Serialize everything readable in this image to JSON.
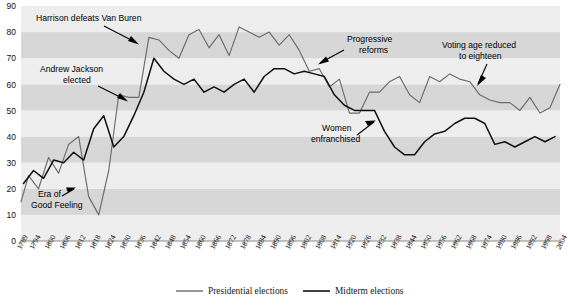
{
  "chart_data": {
    "type": "line",
    "title": "",
    "xlabel": "",
    "ylabel": "",
    "xlim": [
      1789,
      2004
    ],
    "ylim": [
      0,
      90
    ],
    "grid": "horizontal-bands",
    "legend_position": "bottom",
    "y_ticks": [
      0,
      10,
      20,
      30,
      40,
      50,
      60,
      70,
      80,
      90
    ],
    "x_ticks": [
      1789,
      1794,
      1800,
      1806,
      1812,
      1818,
      1824,
      1830,
      1836,
      1842,
      1848,
      1854,
      1860,
      1866,
      1872,
      1878,
      1884,
      1890,
      1896,
      1902,
      1908,
      1914,
      1920,
      1926,
      1932,
      1938,
      1944,
      1950,
      1956,
      1962,
      1968,
      1974,
      1980,
      1986,
      1992,
      1998,
      2004
    ],
    "series": [
      {
        "name": "Presidential elections",
        "color": "#6b6b6b",
        "points": [
          [
            1789,
            15
          ],
          [
            1792,
            25
          ],
          [
            1796,
            20
          ],
          [
            1800,
            32
          ],
          [
            1804,
            26
          ],
          [
            1808,
            37
          ],
          [
            1812,
            40
          ],
          [
            1816,
            17
          ],
          [
            1820,
            10
          ],
          [
            1824,
            27
          ],
          [
            1828,
            56
          ],
          [
            1832,
            55
          ],
          [
            1836,
            55
          ],
          [
            1840,
            78
          ],
          [
            1844,
            77
          ],
          [
            1848,
            73
          ],
          [
            1852,
            70
          ],
          [
            1856,
            79
          ],
          [
            1860,
            81
          ],
          [
            1864,
            74
          ],
          [
            1868,
            79
          ],
          [
            1872,
            71
          ],
          [
            1876,
            82
          ],
          [
            1880,
            80
          ],
          [
            1884,
            78
          ],
          [
            1888,
            80
          ],
          [
            1892,
            75
          ],
          [
            1896,
            79
          ],
          [
            1900,
            73
          ],
          [
            1904,
            65
          ],
          [
            1908,
            66
          ],
          [
            1912,
            59
          ],
          [
            1916,
            62
          ],
          [
            1920,
            49
          ],
          [
            1924,
            49
          ],
          [
            1928,
            57
          ],
          [
            1932,
            57
          ],
          [
            1936,
            61
          ],
          [
            1940,
            63
          ],
          [
            1944,
            56
          ],
          [
            1948,
            53
          ],
          [
            1952,
            63
          ],
          [
            1956,
            61
          ],
          [
            1960,
            64
          ],
          [
            1964,
            62
          ],
          [
            1968,
            61
          ],
          [
            1972,
            56
          ],
          [
            1976,
            54
          ],
          [
            1980,
            53
          ],
          [
            1984,
            53
          ],
          [
            1988,
            50
          ],
          [
            1992,
            55
          ],
          [
            1996,
            49
          ],
          [
            2000,
            51
          ],
          [
            2004,
            60
          ]
        ]
      },
      {
        "name": "Midterm elections",
        "color": "#111111",
        "points": [
          [
            1790,
            22
          ],
          [
            1794,
            27
          ],
          [
            1798,
            24
          ],
          [
            1802,
            31
          ],
          [
            1806,
            30
          ],
          [
            1810,
            34
          ],
          [
            1814,
            31
          ],
          [
            1818,
            43
          ],
          [
            1822,
            48
          ],
          [
            1826,
            36
          ],
          [
            1830,
            40
          ],
          [
            1834,
            48
          ],
          [
            1838,
            57
          ],
          [
            1842,
            70
          ],
          [
            1846,
            65
          ],
          [
            1850,
            62
          ],
          [
            1854,
            60
          ],
          [
            1858,
            62
          ],
          [
            1862,
            57
          ],
          [
            1866,
            59
          ],
          [
            1870,
            57
          ],
          [
            1874,
            60
          ],
          [
            1878,
            62
          ],
          [
            1882,
            57
          ],
          [
            1886,
            63
          ],
          [
            1890,
            66
          ],
          [
            1894,
            66
          ],
          [
            1898,
            64
          ],
          [
            1902,
            65
          ],
          [
            1906,
            64
          ],
          [
            1910,
            63
          ],
          [
            1914,
            56
          ],
          [
            1918,
            52
          ],
          [
            1922,
            50
          ],
          [
            1926,
            50
          ],
          [
            1930,
            50
          ],
          [
            1934,
            42
          ],
          [
            1938,
            36
          ],
          [
            1942,
            33
          ],
          [
            1946,
            33
          ],
          [
            1950,
            38
          ],
          [
            1954,
            41
          ],
          [
            1958,
            42
          ],
          [
            1962,
            45
          ],
          [
            1966,
            47
          ],
          [
            1970,
            47
          ],
          [
            1974,
            45
          ],
          [
            1978,
            37
          ],
          [
            1982,
            38
          ],
          [
            1986,
            36
          ],
          [
            1990,
            38
          ],
          [
            1994,
            40
          ],
          [
            1998,
            38
          ],
          [
            2002,
            40
          ]
        ]
      }
    ],
    "annotations": [
      {
        "id": "harrison",
        "lines": [
          "Harrison defeats Van Buren"
        ]
      },
      {
        "id": "jackson",
        "lines": [
          "Andrew Jackson",
          "elected"
        ]
      },
      {
        "id": "era-good-feeling",
        "lines": [
          "Era of",
          "Good Feeling"
        ]
      },
      {
        "id": "progressive",
        "lines": [
          "Progressive",
          "reforms"
        ]
      },
      {
        "id": "women",
        "lines": [
          "Women",
          "enfranchised"
        ]
      },
      {
        "id": "voting-age",
        "lines": [
          "Voting age reduced",
          "to eighteen"
        ]
      }
    ]
  },
  "legend": {
    "items": [
      {
        "label": "Presidential elections",
        "color": "#6b6b6b"
      },
      {
        "label": "Midterm elections",
        "color": "#111111"
      }
    ]
  },
  "colors": {
    "band_light": "#eeeeee",
    "band_dark": "#d7d7d7",
    "axis": "#8a8a8a",
    "presidential_line": "#6b6b6b",
    "midterm_line": "#111111",
    "background": "#ffffff"
  },
  "y_tick_labels": [
    "90",
    "80",
    "70",
    "60",
    "50",
    "40",
    "30",
    "20",
    "10",
    "0"
  ],
  "x_tick_labels": [
    "1789",
    "1794",
    "1800",
    "1806",
    "1812",
    "1818",
    "1824",
    "1830",
    "1836",
    "1842",
    "1848",
    "1854",
    "1860",
    "1866",
    "1872",
    "1878",
    "1884",
    "1890",
    "1896",
    "1902",
    "1908",
    "1914",
    "1920",
    "1926",
    "1932",
    "1938",
    "1944",
    "1950",
    "1956",
    "1962",
    "1968",
    "1974",
    "1980",
    "1986",
    "1992",
    "1998",
    "2004"
  ],
  "annotation_text": {
    "harrison": "Harrison defeats Van Buren",
    "jackson_l1": "Andrew Jackson",
    "jackson_l2": "elected",
    "era_l1": "Era of",
    "era_l2": "Good Feeling",
    "progressive_l1": "Progressive",
    "progressive_l2": "reforms",
    "women_l1": "Women",
    "women_l2": "enfranchised",
    "voting_l1": "Voting age reduced",
    "voting_l2": "to eighteen"
  }
}
